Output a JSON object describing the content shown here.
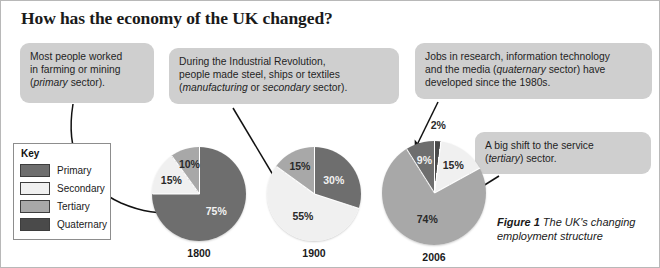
{
  "title": "How has the economy of the UK changed?",
  "callouts": {
    "primary": {
      "line1": "Most people worked",
      "line2": "in farming or mining",
      "line3_pre": "(",
      "line3_em": "primary",
      "line3_post": " sector)."
    },
    "secondary": {
      "line1": "During the Industrial Revolution,",
      "line2": "people made steel, ships or textiles",
      "line3_pre": "(",
      "line3_em1": "manufacturing",
      "line3_mid": " or ",
      "line3_em2": "secondary",
      "line3_post": " sector)."
    },
    "quaternary": {
      "line1": "Jobs in research, information technology",
      "line2_pre": "and the media (",
      "line2_em": "quaternary",
      "line2_post": " sector) have",
      "line3": "developed since the 1980s."
    },
    "tertiary": {
      "line1": "A big shift to the service",
      "line2_pre": "(",
      "line2_em": "tertiary",
      "line2_post": ") sector."
    }
  },
  "key": {
    "title": "Key",
    "items": [
      {
        "label": "Primary",
        "color": "#6e6e6e"
      },
      {
        "label": "Secondary",
        "color": "#f0f0f0"
      },
      {
        "label": "Tertiary",
        "color": "#a8a8a8"
      },
      {
        "label": "Quaternary",
        "color": "#4a4a4a"
      }
    ]
  },
  "caption": {
    "figure_number": "Figure 1",
    "text": " The UK's changing employment structure"
  },
  "chart_data": [
    {
      "type": "pie",
      "title": "1800",
      "categories": [
        "Primary",
        "Secondary",
        "Tertiary"
      ],
      "values": [
        75,
        15,
        10
      ],
      "labels": [
        "75%",
        "15%",
        "10%"
      ],
      "colors": [
        "#6e6e6e",
        "#f0f0f0",
        "#a8a8a8"
      ],
      "start_angle_deg": 0,
      "direction": "clockwise"
    },
    {
      "type": "pie",
      "title": "1900",
      "categories": [
        "Primary",
        "Secondary",
        "Tertiary"
      ],
      "values": [
        30,
        55,
        15
      ],
      "labels": [
        "30%",
        "55%",
        "15%"
      ],
      "colors": [
        "#6e6e6e",
        "#f0f0f0",
        "#a8a8a8"
      ],
      "start_angle_deg": 0,
      "direction": "clockwise"
    },
    {
      "type": "pie",
      "title": "2006",
      "categories": [
        "Quaternary",
        "Secondary",
        "Tertiary",
        "Primary"
      ],
      "values": [
        2,
        15,
        74,
        9
      ],
      "labels": [
        "2%",
        "15%",
        "74%",
        "9%"
      ],
      "colors": [
        "#4a4a4a",
        "#f0f0f0",
        "#a8a8a8",
        "#6e6e6e"
      ],
      "start_angle_deg": 0,
      "direction": "clockwise"
    }
  ]
}
